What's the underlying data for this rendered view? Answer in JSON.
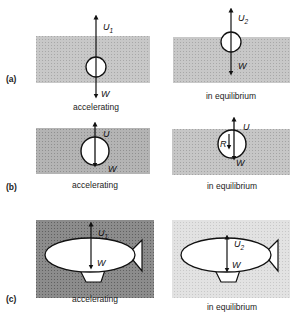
{
  "figure": {
    "panels": [
      {
        "id": "a",
        "label": "(a)",
        "left": {
          "caption": "accelerating",
          "object": "balloon",
          "upward_force": {
            "symbol": "U",
            "subscript": "1"
          },
          "downward_force": {
            "symbol": "W"
          },
          "fluid_shade": "#c8c8c8"
        },
        "right": {
          "caption": "in equilibrium",
          "object": "balloon",
          "upward_force": {
            "symbol": "U",
            "subscript": "2"
          },
          "downward_force": {
            "symbol": "W"
          },
          "fluid_shade": "#c8c8c8"
        }
      },
      {
        "id": "b",
        "label": "(b)",
        "left": {
          "caption": "accelerating",
          "object": "sphere",
          "upward_force": {
            "symbol": "U"
          },
          "downward_force": {
            "symbol": "W"
          },
          "fluid_shade": "#b4b4b4"
        },
        "right": {
          "caption": "in equilibrium",
          "object": "sphere",
          "upward_force": {
            "symbol": "U"
          },
          "resistance_force": {
            "symbol": "R"
          },
          "downward_force": {
            "symbol": "W"
          },
          "fluid_shade": "#c4c4c4"
        }
      },
      {
        "id": "c",
        "label": "(c)",
        "left": {
          "caption": "accelerating",
          "object": "airship",
          "upward_force": {
            "symbol": "U",
            "subscript": "1"
          },
          "downward_force": {
            "symbol": "W"
          },
          "fluid_shade": "#8c8c8c"
        },
        "right": {
          "caption": "in equilibrium",
          "object": "airship",
          "upward_force": {
            "symbol": "U",
            "subscript": "2"
          },
          "downward_force": {
            "symbol": "W"
          },
          "fluid_shade": "#e0e0e0"
        }
      }
    ]
  }
}
